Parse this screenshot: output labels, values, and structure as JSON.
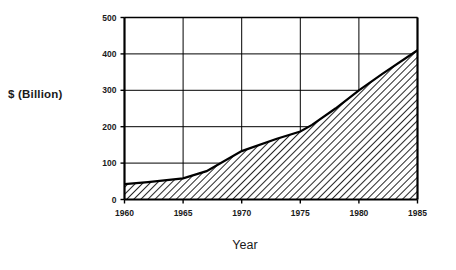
{
  "chart_data": {
    "type": "area",
    "title": "",
    "xlabel": "Year",
    "ylabel": "$  (Billion)",
    "xlim": [
      1960,
      1985
    ],
    "ylim": [
      0,
      500
    ],
    "xticks": [
      1960,
      1965,
      1970,
      1975,
      1980,
      1985
    ],
    "xtick_labels": [
      "1960",
      "1965",
      "1970",
      "1975",
      "1980",
      "1985"
    ],
    "yticks": [
      0,
      100,
      200,
      300,
      400,
      500
    ],
    "ytick_labels": [
      "0",
      "100",
      "200",
      "300",
      "400",
      "500"
    ],
    "grid": true,
    "legend": null,
    "fill_style": "diagonal-hatch",
    "line_color": "#000000",
    "fill_color": "#ffffff",
    "hatch_color": "#000000",
    "background_color": "#ffffff",
    "x": [
      1960,
      1962,
      1965,
      1967,
      1970,
      1973,
      1975,
      1976,
      1978,
      1980,
      1982,
      1985
    ],
    "values": [
      42,
      48,
      58,
      78,
      133,
      167,
      187,
      205,
      250,
      300,
      345,
      410
    ],
    "series": [
      {
        "name": "$ (Billion)",
        "values": [
          42,
          48,
          58,
          78,
          133,
          167,
          187,
          205,
          250,
          300,
          345,
          410
        ]
      }
    ]
  },
  "axes": {
    "y_title": "$  (Billion)",
    "x_title": "Year"
  }
}
